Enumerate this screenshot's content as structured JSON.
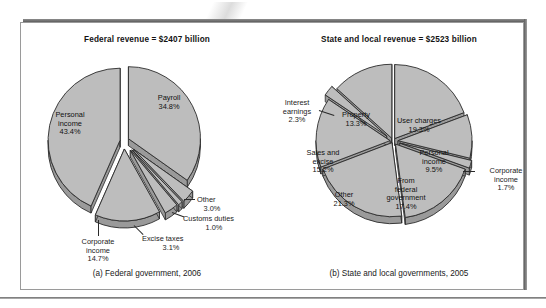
{
  "figure": {
    "background": "#ffffff",
    "pie_fill": "#bdbdbd",
    "pie_side": "#9a9a9a",
    "pie_edge": "#2b2b2b"
  },
  "panels": [
    {
      "id": "federal",
      "title": "Federal revenue = $2407 billion",
      "caption": "(a) Federal government, 2006"
    },
    {
      "id": "state-local",
      "title": "State and local revenue = $2523 billion",
      "caption": "(b) State and local governments, 2005"
    }
  ],
  "chart_data": [
    {
      "type": "pie",
      "title": "Federal revenue = $2407 billion",
      "subtitle": "(a) Federal government, 2006",
      "total_label": "$2407 billion",
      "total_value": 2407,
      "units": "billions of dollars",
      "exploded": true,
      "three_d": true,
      "legend": "none",
      "categories": [
        "Personal income",
        "Payroll",
        "Corporate income",
        "Excise taxes",
        "Customs duties",
        "Other"
      ],
      "values": [
        43.4,
        34.8,
        14.7,
        3.1,
        1.0,
        3.0
      ],
      "value_suffix": "%",
      "slices": [
        {
          "label": "Personal income",
          "value": 43.4,
          "display": "43.4%",
          "label_text": "Personal\nincome\n43.4%",
          "callout": false
        },
        {
          "label": "Payroll",
          "value": 34.8,
          "display": "34.8%",
          "label_text": "Payroll\n34.8%",
          "callout": false
        },
        {
          "label": "Corporate income",
          "value": 14.7,
          "display": "14.7%",
          "label_text": "Corporate\nincome\n14.7%",
          "callout": true
        },
        {
          "label": "Excise taxes",
          "value": 3.1,
          "display": "3.1%",
          "label_text": "Excise taxes\n3.1%",
          "callout": true
        },
        {
          "label": "Customs duties",
          "value": 1.0,
          "display": "1.0%",
          "label_text": "Customs duties\n1.0%",
          "callout": true
        },
        {
          "label": "Other",
          "value": 3.0,
          "display": "3.0%",
          "label_text": "Other\n3.0%",
          "callout": true
        }
      ]
    },
    {
      "type": "pie",
      "title": "State and local revenue = $2523 billion",
      "subtitle": "(b) State and local governments, 2005",
      "total_label": "$2523 billion",
      "total_value": 2523,
      "units": "billions of dollars",
      "exploded": true,
      "three_d": true,
      "legend": "none",
      "categories": [
        "User charges",
        "Personal income",
        "Corporate income",
        "From federal government",
        "Other",
        "Sales and excise",
        "Property",
        "Interest earnings"
      ],
      "values": [
        19.3,
        9.5,
        1.7,
        17.4,
        21.3,
        15.2,
        13.3,
        2.3
      ],
      "value_suffix": "%",
      "slices": [
        {
          "label": "User charges",
          "value": 19.3,
          "display": "19.3%",
          "label_text": "User charges\n19.3%",
          "callout": false
        },
        {
          "label": "Personal income",
          "value": 9.5,
          "display": "9.5%",
          "label_text": "Personal\nincome\n9.5%",
          "callout": false
        },
        {
          "label": "Corporate income",
          "value": 1.7,
          "display": "1.7%",
          "label_text": "Corporate\nincome\n1.7%",
          "callout": true
        },
        {
          "label": "From federal government",
          "value": 17.4,
          "display": "17.4%",
          "label_text": "From\nfederal\ngovernment\n17.4%",
          "callout": false
        },
        {
          "label": "Other",
          "value": 21.3,
          "display": "21.3%",
          "label_text": "Other\n21.3%",
          "callout": false
        },
        {
          "label": "Sales and excise",
          "value": 15.2,
          "display": "15.2%",
          "label_text": "Sales and\nexcise\n15.2%",
          "callout": false
        },
        {
          "label": "Property",
          "value": 13.3,
          "display": "13.3%",
          "label_text": "Property\n13.3%",
          "callout": false
        },
        {
          "label": "Interest earnings",
          "value": 2.3,
          "display": "2.3%",
          "label_text": "Interest\nearnings\n2.3%",
          "callout": true
        }
      ]
    }
  ],
  "labels": {
    "federal": {
      "personal_income_l1": "Personal",
      "personal_income_l2": "income",
      "personal_income_l3": "43.4%",
      "payroll_l1": "Payroll",
      "payroll_l2": "34.8%",
      "corporate_l1": "Corporate",
      "corporate_l2": "income",
      "corporate_l3": "14.7%",
      "excise_l1": "Excise taxes",
      "excise_l2": "3.1%",
      "customs_l1": "Customs duties",
      "customs_l2": "1.0%",
      "other_l1": "Other",
      "other_l2": "3.0%"
    },
    "state": {
      "interest_l1": "Interest",
      "interest_l2": "earnings",
      "interest_l3": "2.3%",
      "property_l1": "Property",
      "property_l2": "13.3%",
      "user_charges_l1": "User charges",
      "user_charges_l2": "19.3%",
      "personal_l1": "Personal",
      "personal_l2": "income",
      "personal_l3": "9.5%",
      "corporate_l1": "Corporate",
      "corporate_l2": "income",
      "corporate_l3": "1.7%",
      "from_federal_l1": "From",
      "from_federal_l2": "federal",
      "from_federal_l3": "government",
      "from_federal_l4": "17.4%",
      "other_l1": "Other",
      "other_l2": "21.3%",
      "sales_l1": "Sales and",
      "sales_l2": "excise",
      "sales_l3": "15.2%"
    }
  }
}
